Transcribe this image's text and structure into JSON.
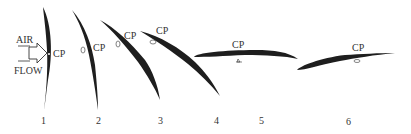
{
  "diagram": {
    "air_flow_label_top": "AIR",
    "air_flow_label_bottom": "FLOW",
    "cp_label": "CP",
    "positions": [
      {
        "number": "1",
        "cp": "CP"
      },
      {
        "number": "2",
        "cp": "CP"
      },
      {
        "number": "3",
        "cp": "CP"
      },
      {
        "number": "4",
        "cp": ""
      },
      {
        "number": "5",
        "cp": "CP"
      },
      {
        "number": "6",
        "cp": "CP"
      }
    ],
    "colors": {
      "airfoil": "#1e1e1e",
      "text": "#333333",
      "background": "#ffffff"
    }
  }
}
